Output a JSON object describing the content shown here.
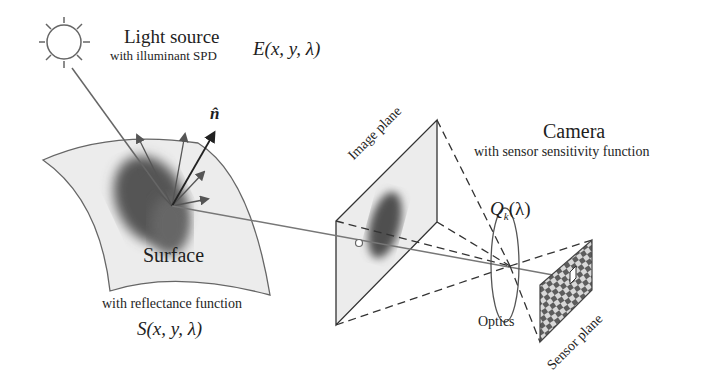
{
  "diagram": {
    "type": "image-formation-pipeline",
    "colors": {
      "line": "#555555",
      "dark": "#222222",
      "surface_fill": "#ececec",
      "blob": "#5a5a5a",
      "sensor_a": "#5d5d5d",
      "sensor_b": "#d8d8d8"
    },
    "light_source": {
      "title": "Light source",
      "subtitle": "with illuminant SPD",
      "formula": "E(x, y, λ)",
      "icon": "sun-icon"
    },
    "surface": {
      "title": "Surface",
      "subtitle": "with reflectance function",
      "formula": "S(x, y, λ)",
      "normal_label": "n̂"
    },
    "image_plane": {
      "label": "Image plane"
    },
    "camera": {
      "title": "Camera",
      "subtitle": "with sensor sensitivity function",
      "formula": "Q",
      "formula_sub": "k",
      "formula_tail": "(λ)"
    },
    "optics": {
      "label": "Optics"
    },
    "sensor_plane": {
      "label": "Sensor plane"
    }
  }
}
